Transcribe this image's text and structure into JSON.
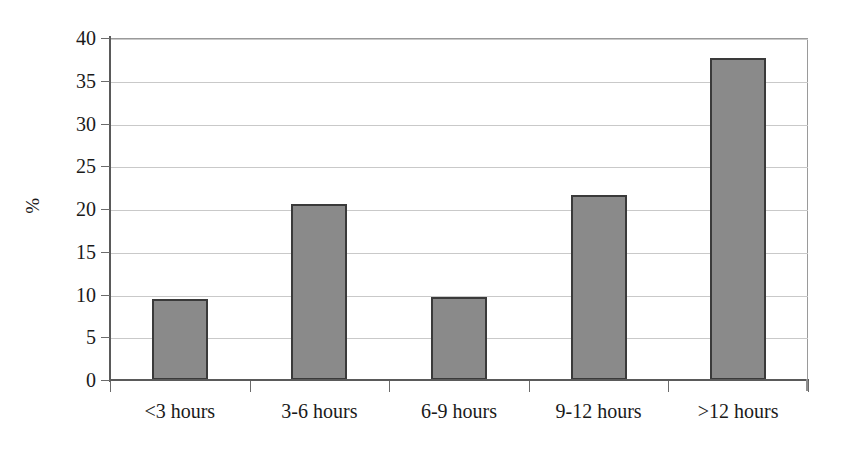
{
  "chart_data": {
    "type": "bar",
    "title": "",
    "subtitle": "",
    "xlabel": "",
    "ylabel": "%",
    "categories": [
      "<3 hours",
      "3-6 hours",
      "6-9 hours",
      "9-12 hours",
      ">12 hours"
    ],
    "values": [
      9.5,
      20.6,
      9.7,
      21.6,
      37.7
    ],
    "ylim": [
      0,
      40
    ],
    "ytick_step": 5,
    "yticks": [
      0,
      5,
      10,
      15,
      20,
      25,
      30,
      35,
      40
    ],
    "ytick_labels": [
      "0",
      "5",
      "10",
      "15",
      "20",
      "25",
      "30",
      "35",
      "40"
    ],
    "grid": true,
    "grid_axis": "y",
    "legend": false,
    "legend_position": "none",
    "annotations": [],
    "colors": {
      "bar_fill": "#8a8a8a",
      "bar_border": "#3a3a3a",
      "gridline": "#c9c9c9",
      "axis": "#5a5a5a",
      "background": "#ffffff",
      "text": "#1a1a1a"
    }
  }
}
